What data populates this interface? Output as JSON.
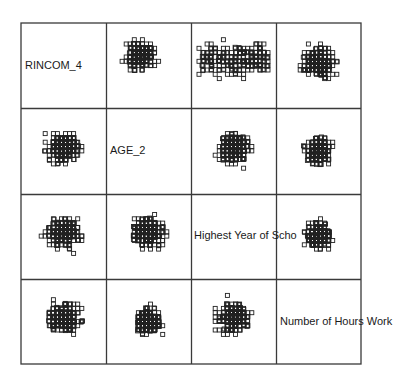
{
  "chart_data": {
    "type": "scatter",
    "subtype": "scatterplot-matrix",
    "title": "",
    "variables": [
      "RINCOM_4",
      "AGE_2",
      "Highest Year of School",
      "Number of Hours Work"
    ],
    "diagonal_labels": [
      "RINCOM_4",
      "AGE_2",
      "Highest Year of Scho",
      "Number of Hours Work"
    ],
    "marker": "open-square",
    "axes_ticks": "none",
    "grid": {
      "rows": 4,
      "cols": 4,
      "left": 21,
      "top": 23,
      "right": 361,
      "bottom": 364
    },
    "colors": {
      "border": "#3a3a3a",
      "marker": "#222222",
      "text": "#1a1a1a",
      "background": "#ffffff"
    },
    "cells": [
      {
        "row": 0,
        "col": 1,
        "x_var": "AGE_2",
        "y_var": "RINCOM_4",
        "pattern": "dense-top-left, sparse bottom bands",
        "seed": 11
      },
      {
        "row": 0,
        "col": 2,
        "x_var": "Highest Year of School",
        "y_var": "RINCOM_4",
        "pattern": "grid rows, wide spread",
        "seed": 12
      },
      {
        "row": 0,
        "col": 3,
        "x_var": "Number of Hours Work",
        "y_var": "RINCOM_4",
        "pattern": "central column dense",
        "seed": 13
      },
      {
        "row": 1,
        "col": 0,
        "x_var": "RINCOM_4",
        "y_var": "AGE_2",
        "pattern": "vertical columns, dense center",
        "seed": 21
      },
      {
        "row": 1,
        "col": 2,
        "x_var": "Highest Year of School",
        "y_var": "AGE_2",
        "pattern": "columns, dense center",
        "seed": 22
      },
      {
        "row": 1,
        "col": 3,
        "x_var": "Number of Hours Work",
        "y_var": "AGE_2",
        "pattern": "blob center",
        "seed": 23
      },
      {
        "row": 2,
        "col": 0,
        "x_var": "RINCOM_4",
        "y_var": "Highest Year of School",
        "pattern": "grid upper, sparse lower",
        "seed": 31
      },
      {
        "row": 2,
        "col": 1,
        "x_var": "AGE_2",
        "y_var": "Highest Year of School",
        "pattern": "rows, dense center band",
        "seed": 32
      },
      {
        "row": 2,
        "col": 3,
        "x_var": "Number of Hours Work",
        "y_var": "Highest Year of School",
        "pattern": "central column blob",
        "seed": 33
      },
      {
        "row": 3,
        "col": 0,
        "x_var": "RINCOM_4",
        "y_var": "Number of Hours Work",
        "pattern": "columns, center band dense",
        "seed": 41
      },
      {
        "row": 3,
        "col": 1,
        "x_var": "AGE_2",
        "y_var": "Number of Hours Work",
        "pattern": "blob center",
        "seed": 42
      },
      {
        "row": 3,
        "col": 2,
        "x_var": "Highest Year of School",
        "y_var": "Number of Hours Work",
        "pattern": "columns, center band dense",
        "seed": 43
      }
    ]
  }
}
